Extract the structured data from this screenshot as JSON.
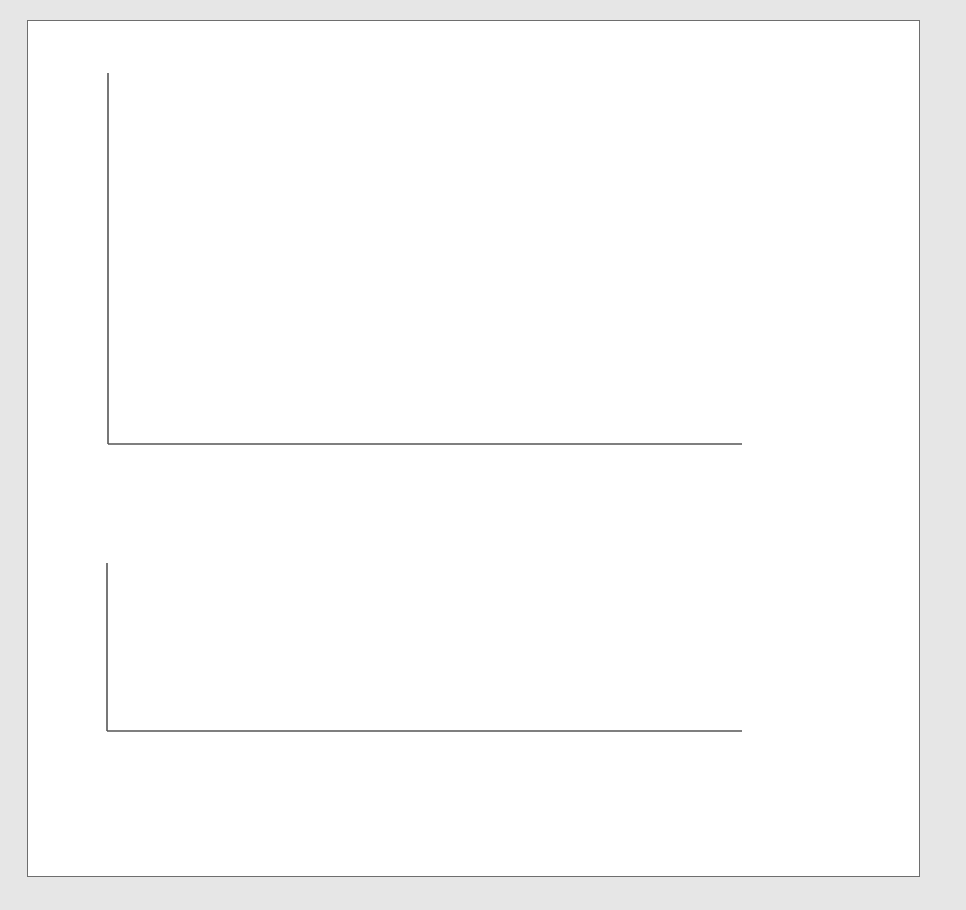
{
  "chart_data": [
    {
      "type": "line",
      "title": "Total product curve",
      "ylabel": "Q (meals/wk)",
      "xlabel": "L",
      "xlim": [
        0,
        10
      ],
      "ylim": [
        0,
        86
      ],
      "x_ticks": [
        1,
        2,
        3,
        4,
        5,
        6,
        7,
        8,
        9,
        10
      ],
      "y_tick_labels": [
        14,
        43,
        72,
        86
      ],
      "y_minor_ticks_every": 10,
      "grid": false,
      "series": [
        {
          "name": "Q = F(K0, L)",
          "x": [
            0,
            1,
            2,
            3,
            4,
            5,
            6,
            7,
            8,
            9,
            10
          ],
          "values": [
            0,
            3.7,
            14,
            27,
            43,
            58.3,
            72,
            81.7,
            86,
            81,
            66
          ]
        }
      ],
      "rays": [
        {
          "name": "R1",
          "from": [
            0,
            0
          ],
          "through": [
            2,
            14
          ],
          "to_x": 3.1
        },
        {
          "name": "R2",
          "from": [
            0,
            0
          ],
          "through": [
            8,
            86
          ],
          "to_x": 8.9
        },
        {
          "name": "R3",
          "from": [
            0,
            0
          ],
          "through": [
            6,
            72
          ],
          "to_x": 7.4
        }
      ],
      "highlighted_points": [
        [
          2,
          14
        ],
        [
          8,
          86
        ]
      ],
      "guide_lines": [
        {
          "x": 2,
          "y": 14
        },
        {
          "x": 4,
          "y": 43
        },
        {
          "x": 6.2,
          "y": 72
        },
        {
          "x": 8,
          "y": 86
        }
      ],
      "annotations": [
        "R1",
        "R2",
        "R3",
        "Q = F(K0, L)"
      ]
    },
    {
      "type": "line",
      "title": "Marginal and average product curves",
      "ylabel": "MP, AP (meals/person-hr)",
      "xlabel": "L (person-hr/wk)",
      "xlim": [
        0,
        10
      ],
      "ylim": [
        0,
        16
      ],
      "x_ticks": [
        1,
        2,
        3,
        4,
        5,
        6,
        7,
        8,
        9,
        10
      ],
      "y_tick_labels": [
        10.75,
        12,
        16
      ],
      "grid": false,
      "series": [
        {
          "name": "MP_L",
          "x": [
            0,
            1,
            2,
            3,
            4,
            5,
            6,
            7,
            8,
            9,
            9.9
          ],
          "values": [
            0,
            7,
            12,
            15,
            16,
            15,
            12,
            7,
            0,
            -9,
            -12.5
          ]
        },
        {
          "name": "AP_L",
          "x": [
            0,
            1,
            2,
            3,
            4,
            5,
            6,
            7,
            8,
            9,
            10
          ],
          "values": [
            0,
            3.7,
            6.7,
            9,
            10.7,
            11.7,
            12,
            11.7,
            10.75,
            9,
            6.5
          ]
        }
      ],
      "guide_lines": [
        {
          "x": 2,
          "y": 12
        },
        {
          "x": 4,
          "y": 16
        },
        {
          "x": 6,
          "y": 12
        },
        {
          "x": 8,
          "y": 10.75
        }
      ],
      "annotations": [
        "MP_L",
        "AP_L"
      ]
    }
  ],
  "top": {
    "ylabel_var": "Q",
    "ylabel_unit": "(meals/wk)",
    "xlabel": "L",
    "y_labels": [
      "86",
      "72",
      "43",
      "14"
    ],
    "x_labels": [
      "1",
      "2",
      "3",
      "4",
      "5",
      "6",
      "7",
      "8",
      "9",
      "10"
    ],
    "r1": "R",
    "r1_sub": "1",
    "r2": "R",
    "r2_sub": "2",
    "r3": "R",
    "r3_sub": "3",
    "curve_label_a": "Q = F(K",
    "curve_label_sub": "0",
    "curve_label_b": ", L)"
  },
  "bottom": {
    "ylabel_var": "MP, AP",
    "ylabel_unit": "(meals/person-hr)",
    "xlabel_var": "L",
    "xlabel_unit": "(person-hr/wk)",
    "y_labels": [
      "16",
      "12",
      "10.75"
    ],
    "x_labels": [
      "1",
      "2",
      "3",
      "4",
      "5",
      "6",
      "7",
      "8",
      "9",
      "10"
    ],
    "ap_label": "AP",
    "ap_sub": "L",
    "mp_label": "MP",
    "mp_sub": "L"
  }
}
